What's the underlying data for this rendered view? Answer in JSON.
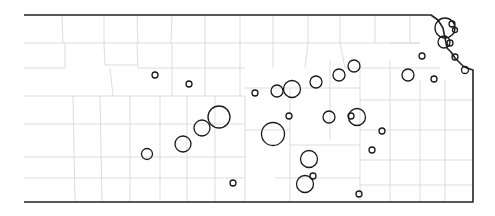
{
  "map": {
    "region": "Kansas",
    "feature": "county boundaries with proportional circle symbols",
    "colors": {
      "background": "#ffffff",
      "state_outline": "#222222",
      "county_lines": "#d4d4d4",
      "circle_stroke": "#1a1a1a"
    },
    "outline_points": "24,15 431,15 438,20 443,28 445,38 447,48 451,52 455,58 459,62 463,66 467,68 473,70 473,202 24,202",
    "county_lines": [
      "M62,16 L63,43",
      "M104,16 L104,43",
      "M137,16 L138,43",
      "M172,16 L171,43",
      "M205,16 L205,43",
      "M240,16 L240,43",
      "M273,16 L273,43",
      "M308,16 L308,43",
      "M340,16 L340,43",
      "M375,16 L375,43",
      "M410,16 L410,43",
      "M24,43 L420,43",
      "M24,68 L65,68",
      "M65,43 L65,68",
      "M104,43 L105,65",
      "M105,65 L137,65",
      "M137,43 L138,68",
      "M172,43 L172,68",
      "M205,43 L205,68",
      "M240,43 L240,68",
      "M273,43 L273,68",
      "M308,43 L305,68",
      "M340,43 L345,68",
      "M24,96 L245,96",
      "M110,68 L113,96",
      "M138,68 L245,68",
      "M172,68 L172,96",
      "M205,68 L205,96",
      "M240,68 L240,96",
      "M73,96 L75,202",
      "M100,96 L102,202",
      "M130,96 L130,202",
      "M160,96 L160,202",
      "M24,124 L245,124",
      "M24,157 L245,157",
      "M24,178 L245,178",
      "M187,96 L187,202",
      "M215,96 L215,202",
      "M245,96 L245,202",
      "M245,88 L360,88",
      "M245,130 L290,130",
      "M290,88 L290,202",
      "M290,145 L360,145",
      "M275,178 L360,178",
      "M330,60 L330,140",
      "M360,60 L360,202",
      "M360,100 L473,100",
      "M390,60 L390,202",
      "M420,80 L420,202",
      "M445,80 L445,202",
      "M360,130 L473,130",
      "M360,160 L473,160",
      "M360,185 L473,185",
      "M345,68 L440,68",
      "M390,43 L420,43"
    ],
    "symbols": [
      {
        "cx": 155,
        "cy": 75,
        "r": 3
      },
      {
        "cx": 189,
        "cy": 84,
        "r": 3
      },
      {
        "cx": 219,
        "cy": 117,
        "r": 11
      },
      {
        "cx": 202,
        "cy": 128,
        "r": 8
      },
      {
        "cx": 183,
        "cy": 144,
        "r": 8
      },
      {
        "cx": 147,
        "cy": 154,
        "r": 5.5
      },
      {
        "cx": 233,
        "cy": 183,
        "r": 3
      },
      {
        "cx": 255,
        "cy": 93,
        "r": 3
      },
      {
        "cx": 277,
        "cy": 91,
        "r": 6
      },
      {
        "cx": 292,
        "cy": 89,
        "r": 8.5
      },
      {
        "cx": 316,
        "cy": 82,
        "r": 6
      },
      {
        "cx": 339,
        "cy": 75,
        "r": 6
      },
      {
        "cx": 354,
        "cy": 66,
        "r": 6
      },
      {
        "cx": 289,
        "cy": 116,
        "r": 3
      },
      {
        "cx": 273,
        "cy": 134,
        "r": 11.5
      },
      {
        "cx": 329,
        "cy": 117,
        "r": 6
      },
      {
        "cx": 357,
        "cy": 117,
        "r": 8.5
      },
      {
        "cx": 351,
        "cy": 116,
        "r": 3
      },
      {
        "cx": 382,
        "cy": 131,
        "r": 3
      },
      {
        "cx": 372,
        "cy": 150,
        "r": 3
      },
      {
        "cx": 309,
        "cy": 159,
        "r": 8.5
      },
      {
        "cx": 305,
        "cy": 184,
        "r": 8.5
      },
      {
        "cx": 313,
        "cy": 176,
        "r": 3
      },
      {
        "cx": 359,
        "cy": 194,
        "r": 3
      },
      {
        "cx": 408,
        "cy": 75,
        "r": 6
      },
      {
        "cx": 422,
        "cy": 56,
        "r": 3
      },
      {
        "cx": 434,
        "cy": 79,
        "r": 3
      },
      {
        "cx": 445,
        "cy": 28,
        "r": 10
      },
      {
        "cx": 444,
        "cy": 42,
        "r": 6
      },
      {
        "cx": 450,
        "cy": 43,
        "r": 3
      },
      {
        "cx": 452,
        "cy": 24,
        "r": 3
      },
      {
        "cx": 455,
        "cy": 30,
        "r": 2.5
      },
      {
        "cx": 455,
        "cy": 57,
        "r": 3
      },
      {
        "cx": 465,
        "cy": 70,
        "r": 3.5
      }
    ]
  }
}
